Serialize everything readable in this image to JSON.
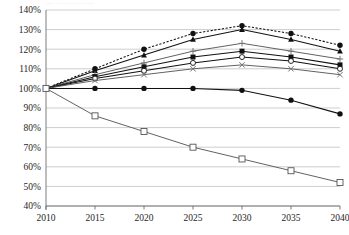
{
  "legend": {
    "cutoff_text": "——  ——  ——   ——  ——"
  },
  "axes": {
    "y_ticks": [
      "140%",
      "130%",
      "120%",
      "110%",
      "100%",
      "90%",
      "80%",
      "70%",
      "60%",
      "50%",
      "40%"
    ],
    "x_ticks": [
      "2010",
      "2015",
      "2020",
      "2025",
      "2030",
      "2035",
      "2040"
    ]
  },
  "chart_data": {
    "type": "line",
    "title": "",
    "subtitle": "",
    "xlabel": "",
    "ylabel": "",
    "x": [
      2010,
      2015,
      2020,
      2025,
      2030,
      2035,
      2040
    ],
    "xlim": [
      2010,
      2040
    ],
    "ylim": [
      40,
      140
    ],
    "y_tick_values": [
      140,
      130,
      120,
      110,
      100,
      90,
      80,
      70,
      60,
      50,
      40
    ],
    "y_unit": "percent",
    "grid": true,
    "legend_position": "top-cropped",
    "series": [
      {
        "name": "series-1",
        "marker": "filled-circle",
        "style": "dotted",
        "values": [
          100,
          110,
          120,
          128,
          132,
          128,
          122
        ]
      },
      {
        "name": "series-2",
        "marker": "filled-triangle",
        "style": "solid",
        "values": [
          100,
          109,
          117,
          125,
          130,
          125,
          119
        ]
      },
      {
        "name": "series-3",
        "marker": "plus",
        "style": "solid",
        "values": [
          100,
          107,
          113,
          119,
          123,
          119,
          115
        ]
      },
      {
        "name": "series-4",
        "marker": "filled-square",
        "style": "solid",
        "values": [
          100,
          106,
          111,
          116,
          119,
          116,
          112
        ]
      },
      {
        "name": "series-5",
        "marker": "open-circle",
        "style": "solid",
        "values": [
          100,
          105,
          109,
          113,
          116,
          114,
          110
        ]
      },
      {
        "name": "series-6",
        "marker": "cross-x",
        "style": "solid",
        "values": [
          100,
          104,
          107,
          110,
          112,
          110,
          107
        ]
      },
      {
        "name": "series-7",
        "marker": "filled-circle",
        "style": "solid",
        "values": [
          100,
          100,
          100,
          100,
          99,
          94,
          87
        ]
      },
      {
        "name": "series-8",
        "marker": "open-square",
        "style": "solid",
        "values": [
          100,
          86,
          78,
          70,
          64,
          58,
          52
        ]
      }
    ]
  }
}
